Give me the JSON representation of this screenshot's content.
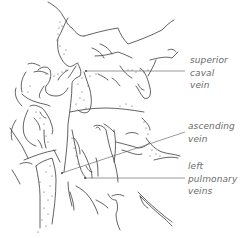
{
  "diagram": {
    "labels": {
      "superior_caval_vein": {
        "lines": [
          "superior",
          "caval",
          "vein"
        ]
      },
      "ascending_vein": {
        "lines": [
          "ascending",
          "vein"
        ]
      },
      "left_pulmonary_veins": {
        "lines": [
          "left",
          "pulmonary",
          "veins"
        ]
      }
    },
    "colors": {
      "line": "#3a3a3a",
      "stipple": "#555555",
      "leader": "#555555",
      "label": "#6a6a6a"
    }
  }
}
